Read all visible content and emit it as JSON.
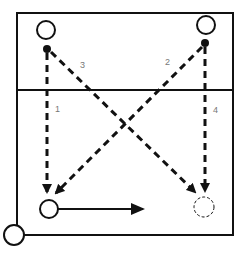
{
  "diagram": {
    "type": "play-diagram",
    "colors": {
      "line": "#111111",
      "label": "#777777",
      "background": "#ffffff"
    },
    "court": {
      "x": 17,
      "y": 13,
      "width": 216,
      "height": 222
    },
    "divider_line": {
      "y": 90
    },
    "players": [
      {
        "id": "top-left-player",
        "cx": 46,
        "cy": 30,
        "r": 9,
        "style": "solid"
      },
      {
        "id": "top-right-player",
        "cx": 206,
        "cy": 25,
        "r": 9,
        "style": "solid"
      },
      {
        "id": "bottom-left-player",
        "cx": 49,
        "cy": 209,
        "r": 9,
        "style": "solid"
      },
      {
        "id": "bottom-right-spot",
        "cx": 204,
        "cy": 207,
        "r": 10,
        "style": "dashed"
      },
      {
        "id": "corner-player",
        "cx": 14,
        "cy": 235,
        "r": 10,
        "style": "solid"
      }
    ],
    "balls": [
      {
        "id": "ball-left",
        "cx": 47,
        "cy": 49,
        "r": 4
      },
      {
        "id": "ball-right",
        "cx": 205,
        "cy": 43,
        "r": 4
      }
    ],
    "passes": [
      {
        "label": "1",
        "x1": 47,
        "y1": 53,
        "x2": 47,
        "y2": 192,
        "lx": 55,
        "ly": 112
      },
      {
        "label": "2",
        "x1": 202,
        "y1": 47,
        "x2": 56,
        "y2": 193,
        "lx": 165,
        "ly": 65
      },
      {
        "label": "3",
        "x1": 51,
        "y1": 52,
        "x2": 195,
        "y2": 192,
        "lx": 80,
        "ly": 68
      },
      {
        "label": "4",
        "x1": 205,
        "y1": 47,
        "x2": 205,
        "y2": 191,
        "lx": 213,
        "ly": 113
      }
    ],
    "movement": {
      "x1": 58,
      "y1": 209,
      "x2": 143,
      "y2": 209
    }
  }
}
